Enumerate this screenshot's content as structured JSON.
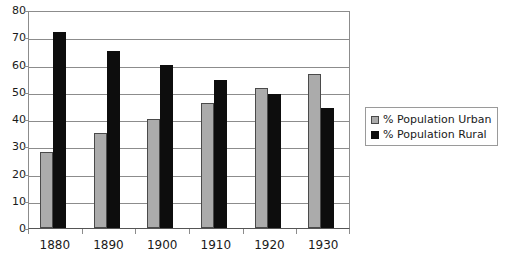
{
  "chart_data": {
    "type": "bar",
    "title": "",
    "subtitle": "",
    "xlabel": "",
    "ylabel": "",
    "categories": [
      "1880",
      "1890",
      "1900",
      "1910",
      "1920",
      "1930"
    ],
    "series": [
      {
        "name": "% Population Urban",
        "color": "#ababab",
        "values": [
          28,
          35,
          40,
          46,
          51.5,
          56.5
        ]
      },
      {
        "name": "% Population Rural",
        "color": "#0d0d0d",
        "values": [
          72,
          65,
          60,
          54.5,
          49,
          44
        ]
      }
    ],
    "ylim": [
      0,
      80
    ],
    "ytick_step": 10,
    "yticks": [
      "0",
      "10",
      "20",
      "30",
      "40",
      "50",
      "60",
      "70",
      "80"
    ],
    "grid": true,
    "grid_axis": "y",
    "legend": {
      "position": "right",
      "entries": [
        {
          "label": "% Population Urban",
          "swatch": "urban-swatch"
        },
        {
          "label": "% Population Rural",
          "swatch": "rural-swatch"
        }
      ]
    }
  }
}
